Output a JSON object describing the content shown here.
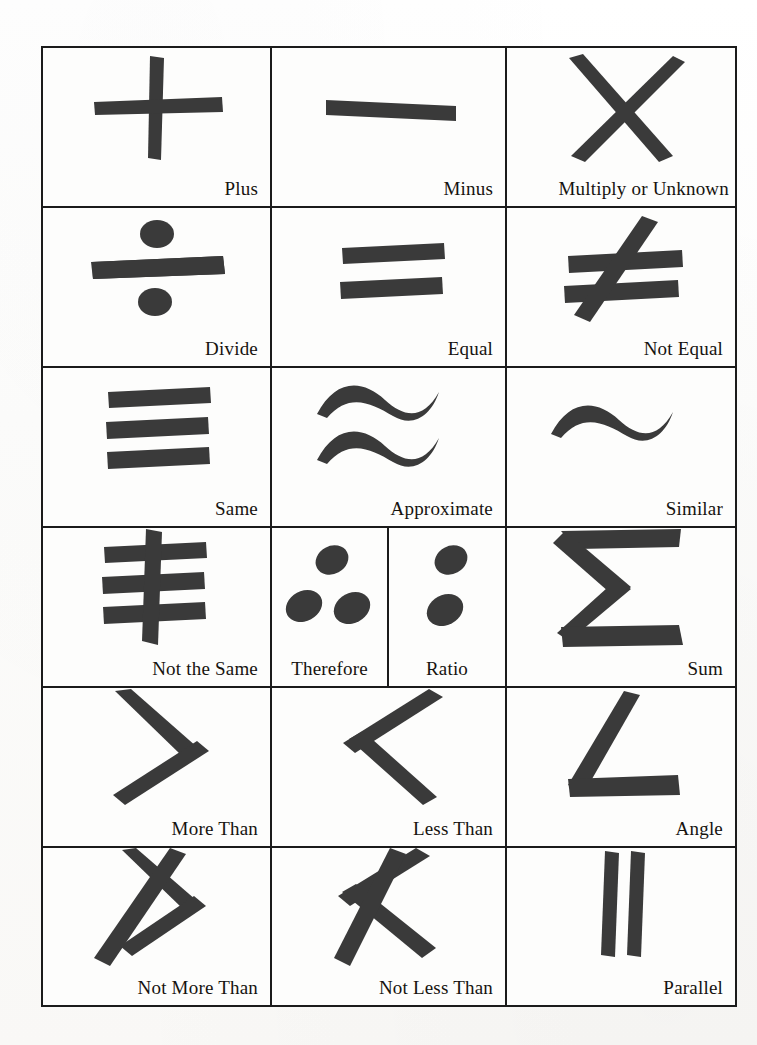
{
  "document": {
    "kind": "mathematical-symbols-chart",
    "ink_color": "#3a3a3a",
    "rule_color": "#1b1b1b",
    "paper_color": "#fbfbfa"
  },
  "table": {
    "columns": 3,
    "rows": 6,
    "cells": [
      {
        "label": "Plus",
        "symbol": "plus",
        "align": "right"
      },
      {
        "label": "Minus",
        "symbol": "minus",
        "align": "right"
      },
      {
        "label": "Multiply or Unknown",
        "symbol": "multiply",
        "align": "right"
      },
      {
        "label": "Divide",
        "symbol": "divide",
        "align": "right"
      },
      {
        "label": "Equal",
        "symbol": "equal",
        "align": "right"
      },
      {
        "label": "Not Equal",
        "symbol": "not-equal",
        "align": "right"
      },
      {
        "label": "Same",
        "symbol": "same",
        "align": "right"
      },
      {
        "label": "Approximate",
        "symbol": "approximate",
        "align": "right"
      },
      {
        "label": "Similar",
        "symbol": "similar",
        "align": "right"
      },
      {
        "label": "Not the Same",
        "symbol": "not-the-same",
        "align": "right"
      },
      {
        "label": "Therefore",
        "symbol": "therefore",
        "align": "center"
      },
      {
        "label": "Ratio",
        "symbol": "ratio",
        "align": "center"
      },
      {
        "label": "Sum",
        "symbol": "sum",
        "align": "right"
      },
      {
        "label": "More Than",
        "symbol": "more-than",
        "align": "right"
      },
      {
        "label": "Less Than",
        "symbol": "less-than",
        "align": "right"
      },
      {
        "label": "Angle",
        "symbol": "angle",
        "align": "right"
      },
      {
        "label": "Not More Than",
        "symbol": "not-more-than",
        "align": "right"
      },
      {
        "label": "Not Less Than",
        "symbol": "not-less-than",
        "align": "right"
      },
      {
        "label": "Parallel",
        "symbol": "parallel",
        "align": "right"
      }
    ]
  }
}
